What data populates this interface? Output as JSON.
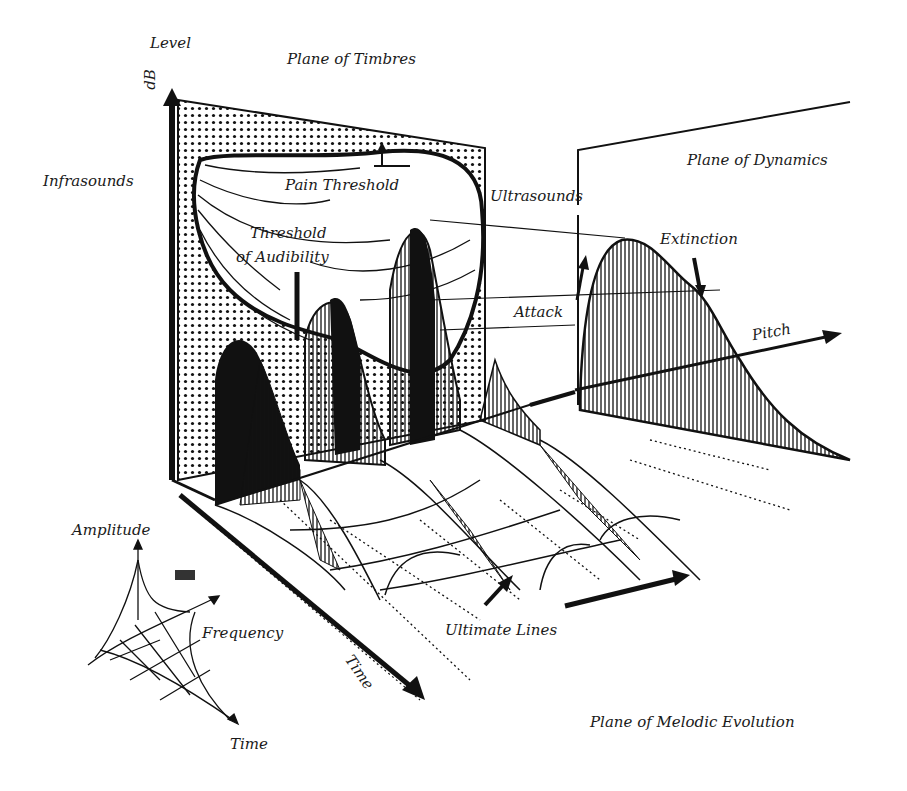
{
  "diagram": {
    "title": "Plane of Timbres",
    "axes": {
      "level": "Level",
      "level_unit": "dB",
      "pitch": "Pitch",
      "time": "Time"
    },
    "planes": {
      "timbres": "Plane of Timbres",
      "dynamics": "Plane of Dynamics",
      "melodic_evolution": "Plane of Melodic Evolution"
    },
    "regions": {
      "infrasounds": "Infrasounds",
      "ultrasounds": "Ultrasounds",
      "pain_threshold": "Pain Threshold",
      "threshold_of_audibility_line1": "Threshold",
      "threshold_of_audibility_line2": "of Audibility"
    },
    "envelope": {
      "attack": "Attack",
      "extinction": "Extinction"
    },
    "ultimate_lines": "Ultimate Lines",
    "inset": {
      "amplitude": "Amplitude",
      "frequency": "Frequency",
      "time": "Time"
    },
    "colors": {
      "ink": "#111111",
      "paper": "#ffffff"
    }
  }
}
